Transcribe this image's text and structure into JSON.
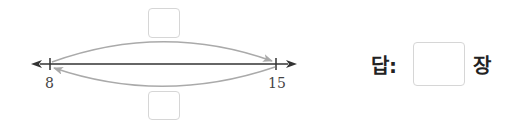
{
  "number_line": {
    "start_value": "8",
    "end_value": "15",
    "line_color": "#333333",
    "arc_color": "#aaaaaa"
  },
  "top_box": {
    "value": ""
  },
  "bottom_box": {
    "value": ""
  },
  "answer": {
    "label": "답:",
    "value": "",
    "unit": "장"
  }
}
